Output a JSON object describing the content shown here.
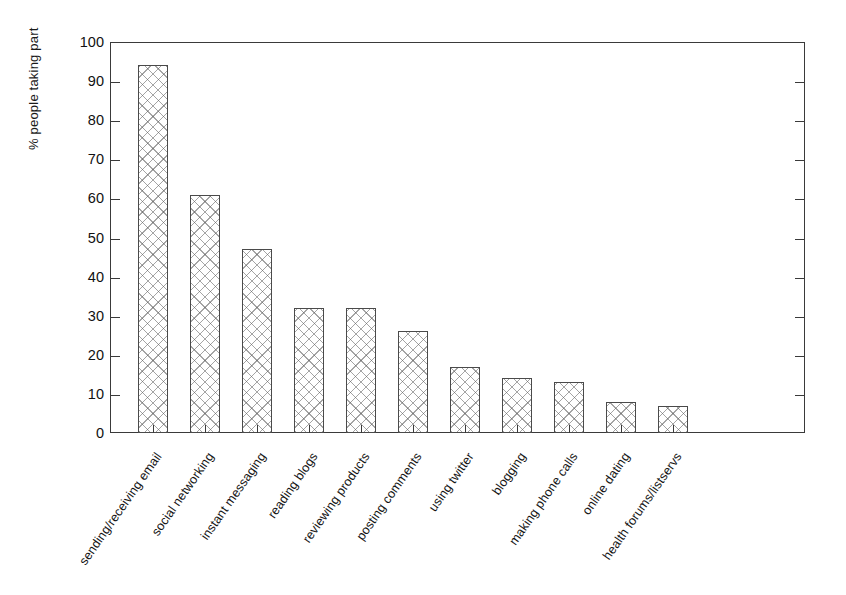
{
  "chart_data": {
    "type": "bar",
    "title": "",
    "xlabel": "",
    "ylabel": "% people taking part",
    "ylim": [
      0,
      100
    ],
    "ytick_labels": [
      "0",
      "10",
      "20",
      "30",
      "40",
      "50",
      "60",
      "70",
      "80",
      "90",
      "100"
    ],
    "ytick_values": [
      0,
      10,
      20,
      30,
      40,
      50,
      60,
      70,
      80,
      90,
      100
    ],
    "grid": false,
    "legend": null,
    "bar_style": {
      "fill": "crosshatch",
      "fill_color": "#ffffff",
      "hatch_color": "#5a5a5a",
      "edge_color": "#4a4a4a"
    },
    "categories": [
      "sending/receiving email",
      "social networking",
      "instant messaging",
      "reading blogs",
      "reviewing products",
      "posting comments",
      "using twitter",
      "blogging",
      "making phone calls",
      "online dating",
      "health forums/listservs"
    ],
    "values": [
      94,
      61,
      47,
      32,
      32,
      26,
      17,
      14,
      13,
      8,
      7
    ]
  }
}
